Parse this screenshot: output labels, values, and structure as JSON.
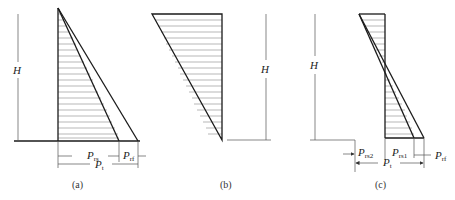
{
  "figures": [
    {
      "id": "a",
      "caption": "(a)",
      "height_label": "H",
      "dimension_labels": {
        "rs": {
          "main": "P",
          "sub": "rs"
        },
        "rf": {
          "main": "P",
          "sub": "rf"
        },
        "t": {
          "main": "P",
          "sub": "t"
        }
      }
    },
    {
      "id": "b",
      "caption": "(b)",
      "height_label": "H"
    },
    {
      "id": "c",
      "caption": "(c)",
      "height_label": "H",
      "dimension_labels": {
        "rs2": {
          "main": "P",
          "sub": "rs2"
        },
        "rs1": {
          "main": "P",
          "sub": "rs1"
        },
        "rf": {
          "main": "P",
          "sub": "rf"
        },
        "t": {
          "main": "P",
          "sub": "t"
        }
      }
    }
  ],
  "colors": {
    "line": "#1a1a1a",
    "hatch": "#888888",
    "background": "#ffffff"
  }
}
